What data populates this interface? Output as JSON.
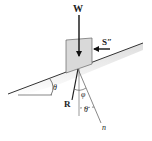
{
  "diagram": {
    "type": "free-body diagram on inclined plane",
    "labels": {
      "weight": "W",
      "side_force": "S″",
      "reaction": "R",
      "friction_angle": "φ",
      "incline_angle_left": "θ",
      "incline_angle_normal": "θ",
      "normal": "n"
    },
    "colors": {
      "line": "#333333",
      "block_fill": "#d9d9d9",
      "ground_shade": "#e6e6e6",
      "arrow": "#111111"
    }
  }
}
